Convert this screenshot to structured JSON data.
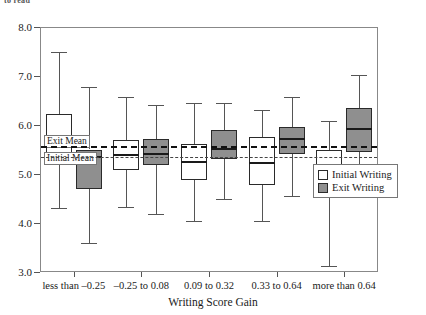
{
  "figure": {
    "clipped_header": "to read",
    "x_axis_title": "Writing Score Gain",
    "y_axis_title": "",
    "exit_mean_label": "Exit Mean",
    "initial_mean_label": "Initial Mean"
  },
  "legend": {
    "items": [
      {
        "label": "Initial Writing",
        "swatch": "white-square",
        "color": "#ffffff"
      },
      {
        "label": "Exit Writing",
        "swatch": "gray-square",
        "color": "#8f8f8f"
      }
    ]
  },
  "chart_data": {
    "type": "box",
    "title": "",
    "xlabel": "Writing Score Gain",
    "ylabel": "",
    "ylim": [
      3.0,
      8.0
    ],
    "ytick_labels": [
      "3.0",
      "4.0",
      "5.0",
      "6.0",
      "7.0",
      "8.0"
    ],
    "yticks": [
      3.0,
      4.0,
      5.0,
      6.0,
      7.0,
      8.0
    ],
    "grid": false,
    "legend_position": "right-middle",
    "categories": [
      "less than –0.25",
      "–0.25 to 0.08",
      "0.09 to 0.32",
      "0.33 to 0.64",
      "more than 0.64"
    ],
    "reference_lines": [
      {
        "name": "Exit Mean",
        "value": 5.57,
        "style": "dashed-bold"
      },
      {
        "name": "Initial Mean",
        "value": 5.35,
        "style": "dashed-light"
      }
    ],
    "series": [
      {
        "name": "Initial Writing",
        "fill": "#ffffff",
        "boxes": [
          {
            "category": "less than –0.25",
            "whisker_low": 4.3,
            "q1": 5.2,
            "median": 5.75,
            "q3": 6.22,
            "whisker_high": 7.5
          },
          {
            "category": "–0.25 to 0.08",
            "whisker_low": 4.32,
            "q1": 5.08,
            "median": 5.38,
            "q3": 5.7,
            "whisker_high": 6.57
          },
          {
            "category": "0.09 to 0.32",
            "whisker_low": 4.05,
            "q1": 4.88,
            "median": 5.25,
            "q3": 5.62,
            "whisker_high": 6.45
          },
          {
            "category": "0.33 to 0.64",
            "whisker_low": 4.05,
            "q1": 4.78,
            "median": 5.22,
            "q3": 5.75,
            "whisker_high": 6.3
          },
          {
            "category": "more than 0.64",
            "whisker_low": 3.12,
            "q1": 4.55,
            "median": 5.0,
            "q3": 5.48,
            "whisker_high": 6.08
          }
        ]
      },
      {
        "name": "Exit Writing",
        "fill": "#8f8f8f",
        "boxes": [
          {
            "category": "less than –0.25",
            "whisker_low": 3.6,
            "q1": 4.7,
            "median": 5.35,
            "q3": 5.5,
            "whisker_high": 6.78
          },
          {
            "category": "–0.25 to 0.08",
            "whisker_low": 4.18,
            "q1": 5.18,
            "median": 5.4,
            "q3": 5.72,
            "whisker_high": 6.4
          },
          {
            "category": "0.09 to 0.32",
            "whisker_low": 4.48,
            "q1": 5.3,
            "median": 5.52,
            "q3": 5.9,
            "whisker_high": 6.45
          },
          {
            "category": "0.33 to 0.64",
            "whisker_low": 4.55,
            "q1": 5.4,
            "median": 5.72,
            "q3": 5.95,
            "whisker_high": 6.58
          },
          {
            "category": "more than 0.64",
            "whisker_low": 4.62,
            "q1": 5.45,
            "median": 5.92,
            "q3": 6.35,
            "whisker_high": 7.02
          }
        ]
      }
    ]
  }
}
